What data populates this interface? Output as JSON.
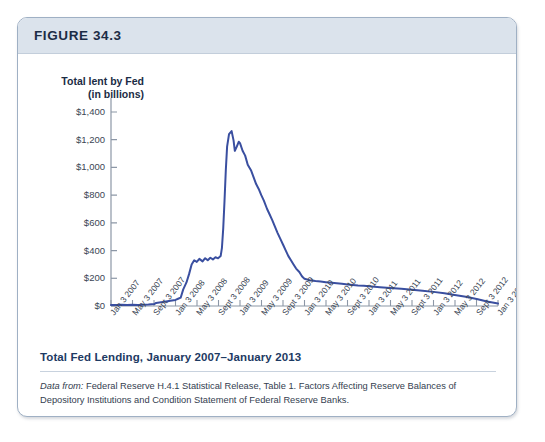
{
  "figure": {
    "number_label": "FIGURE 34.3",
    "caption_title": "Total Fed Lending, January 2007–January 2013",
    "source_lead": "Data from:",
    "source_text": " Federal Reserve H.4.1 Statistical Release, Table 1. Factors Affecting Reserve Balances of Depository Institutions and Condition Statement of Federal Reserve Banks."
  },
  "colors": {
    "line": "#3a4fa0",
    "axis": "#8c97a6",
    "header_band": "#dbe3ec",
    "card_border": "#9fb0c4",
    "caption_blue": "#1d3a63"
  },
  "chart_data": {
    "type": "line",
    "title": "Total Fed Lending, January 2007–January 2013",
    "xlabel": "",
    "ylabel": "Total lent by Fed (in billions)",
    "ylabel_line1": "Total lent by Fed",
    "ylabel_line2": "(in billions)",
    "ylim": [
      0,
      1400
    ],
    "ytick_values": [
      0,
      200,
      400,
      600,
      800,
      1000,
      1200,
      1400
    ],
    "ytick_labels": [
      "$0",
      "$200",
      "$400",
      "$600",
      "$800",
      "$1,000",
      "$1,200",
      "$1,400"
    ],
    "grid": false,
    "legend": "none",
    "units": "billions of dollars",
    "xtick_labels": [
      "Jan 3 2007",
      "May 3 2007",
      "Sept 3 2007",
      "Jan 3 2008",
      "May 3 2008",
      "Sept 3 2008",
      "Jan 3 2009",
      "May 3 2009",
      "Sept 3 2009",
      "Jan 3 2010",
      "May 3 2010",
      "Sept 3 2010",
      "Jan 3 2011",
      "May 3 2011",
      "Sept 3 2011",
      "Jan 3 2012",
      "May 3 2012",
      "Sept 3 2012",
      "Jan 3 2013"
    ],
    "x": [
      2007.0,
      2007.08,
      2007.17,
      2007.25,
      2007.33,
      2007.42,
      2007.5,
      2007.58,
      2007.67,
      2007.7,
      2007.75,
      2007.83,
      2007.92,
      2008.0,
      2008.04,
      2008.08,
      2008.12,
      2008.17,
      2008.21,
      2008.25,
      2008.29,
      2008.33,
      2008.37,
      2008.42,
      2008.46,
      2008.5,
      2008.54,
      2008.58,
      2008.62,
      2008.66,
      2008.7,
      2008.72,
      2008.74,
      2008.76,
      2008.78,
      2008.8,
      2008.83,
      2008.87,
      2008.9,
      2008.92,
      2008.95,
      2008.98,
      2009.0,
      2009.04,
      2009.08,
      2009.12,
      2009.17,
      2009.21,
      2009.25,
      2009.29,
      2009.33,
      2009.37,
      2009.42,
      2009.46,
      2009.5,
      2009.54,
      2009.58,
      2009.62,
      2009.67,
      2009.71,
      2009.75,
      2009.79,
      2009.83,
      2009.87,
      2009.92,
      2009.96,
      2010.0,
      2010.08,
      2010.17,
      2010.25,
      2010.33,
      2010.42,
      2010.5,
      2010.58,
      2010.67,
      2010.75,
      2010.83,
      2010.92,
      2011.0,
      2011.17,
      2011.33,
      2011.5,
      2011.67,
      2011.83,
      2012.0,
      2012.17,
      2012.33,
      2012.5,
      2012.67,
      2012.83,
      2013.0
    ],
    "values": [
      8,
      8,
      9,
      8,
      9,
      8,
      9,
      10,
      14,
      22,
      26,
      30,
      38,
      44,
      52,
      60,
      120,
      170,
      230,
      300,
      330,
      318,
      340,
      322,
      345,
      330,
      348,
      336,
      352,
      344,
      360,
      420,
      560,
      760,
      980,
      1150,
      1240,
      1262,
      1195,
      1120,
      1150,
      1185,
      1175,
      1120,
      1085,
      1020,
      980,
      930,
      880,
      845,
      800,
      760,
      700,
      660,
      620,
      575,
      530,
      490,
      440,
      400,
      360,
      330,
      300,
      270,
      245,
      215,
      196,
      186,
      180,
      176,
      172,
      168,
      164,
      160,
      156,
      152,
      148,
      146,
      142,
      136,
      130,
      124,
      118,
      110,
      102,
      92,
      80,
      66,
      50,
      32,
      18
    ],
    "annotations": [
      {
        "label": "peak",
        "x": 2008.87,
        "y": 1262
      },
      {
        "label": "2008 plateau",
        "x": 2008.4,
        "y": 335
      },
      {
        "label": "2007 baseline",
        "x": 2007.2,
        "y": 9
      }
    ]
  }
}
